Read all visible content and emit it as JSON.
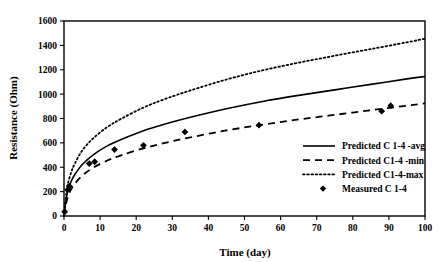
{
  "chart_data": {
    "type": "line",
    "title": "",
    "xlabel": "Time (day)",
    "ylabel": "Resistance (Ohm)",
    "xlim": [
      0,
      100
    ],
    "ylim": [
      0,
      1600
    ],
    "xticks": [
      0,
      10,
      20,
      30,
      40,
      50,
      60,
      70,
      80,
      90,
      100
    ],
    "yticks": [
      0,
      200,
      400,
      600,
      800,
      1000,
      1200,
      1400,
      1600
    ],
    "grid": false,
    "legend_position": "center-right-inside",
    "series": [
      {
        "name": "Predicted C 1-4 -avg",
        "style": "solid",
        "color": "#000000",
        "x": [
          0,
          0.5,
          1,
          2,
          3,
          5,
          8,
          12,
          16,
          22,
          28,
          35,
          45,
          55,
          65,
          75,
          85,
          95,
          100
        ],
        "values": [
          0,
          120,
          200,
          285,
          340,
          420,
          500,
          575,
          630,
          700,
          755,
          810,
          880,
          940,
          990,
          1035,
          1080,
          1125,
          1145
        ]
      },
      {
        "name": "Predicted C1-4 -min",
        "style": "dashed",
        "color": "#000000",
        "x": [
          0,
          0.5,
          1,
          2,
          3,
          5,
          8,
          12,
          16,
          22,
          28,
          35,
          45,
          55,
          65,
          75,
          85,
          95,
          100
        ],
        "values": [
          0,
          90,
          150,
          220,
          265,
          330,
          395,
          455,
          500,
          555,
          600,
          645,
          702,
          750,
          792,
          830,
          868,
          905,
          925
        ]
      },
      {
        "name": "Predicted C1-4-max",
        "style": "dotted",
        "color": "#000000",
        "x": [
          0,
          0.5,
          1,
          2,
          3,
          5,
          8,
          12,
          16,
          22,
          28,
          35,
          45,
          55,
          65,
          75,
          85,
          95,
          100
        ],
        "values": [
          0,
          150,
          255,
          360,
          430,
          535,
          635,
          730,
          800,
          890,
          960,
          1030,
          1120,
          1195,
          1258,
          1315,
          1370,
          1425,
          1455
        ]
      }
    ],
    "scatter": [
      {
        "name": "Measured C 1-4",
        "marker": "diamond",
        "color": "#000000",
        "points": [
          {
            "x": 0.2,
            "y": 35
          },
          {
            "x": 1.0,
            "y": 215
          },
          {
            "x": 1.5,
            "y": 245
          },
          {
            "x": 7.0,
            "y": 430
          },
          {
            "x": 8.5,
            "y": 445
          },
          {
            "x": 14.0,
            "y": 545
          },
          {
            "x": 22.0,
            "y": 580
          },
          {
            "x": 33.5,
            "y": 690
          },
          {
            "x": 54.0,
            "y": 745
          },
          {
            "x": 88.0,
            "y": 860
          },
          {
            "x": 90.5,
            "y": 905
          }
        ]
      }
    ],
    "legend_entries": [
      {
        "label": "Predicted C 1-4 -avg",
        "style": "solid"
      },
      {
        "label": "Predicted C1-4 -min",
        "style": "dashed"
      },
      {
        "label": "Predicted C1-4-max",
        "style": "dotted"
      },
      {
        "label": "Measured C 1-4",
        "style": "marker"
      }
    ]
  }
}
